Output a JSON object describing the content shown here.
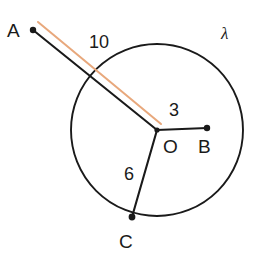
{
  "figure": {
    "kind": "circle-geometry-diagram",
    "width": 274,
    "height": 258,
    "background_color": "#ffffff"
  },
  "colors": {
    "stroke": "#1a1a1a",
    "highlight": "#e8a87c",
    "text": "#1a1a1a"
  },
  "circle": {
    "name": "lambda",
    "label": "λ",
    "center_label": "O",
    "center": {
      "x": 157,
      "y": 130
    },
    "radius": 86
  },
  "points": [
    {
      "id": "A",
      "label": "A",
      "x": 33,
      "y": 30,
      "on_circle": false,
      "dot": true
    },
    {
      "id": "B",
      "label": "B",
      "x": 207,
      "y": 128,
      "on_circle": false,
      "dot": true
    },
    {
      "id": "C",
      "label": "C",
      "x": 132,
      "y": 217,
      "on_circle": true,
      "dot": true
    },
    {
      "id": "O",
      "label": "O",
      "x": 157,
      "y": 130,
      "on_circle": false,
      "dot": true
    }
  ],
  "segments": [
    {
      "id": "AO",
      "from": "A",
      "to": "O",
      "length_label": "10",
      "color": "#1a1a1a",
      "x1": 33,
      "y1": 30,
      "x2": 157,
      "y2": 130
    },
    {
      "id": "OB",
      "from": "O",
      "to": "B",
      "length_label": "3",
      "color": "#1a1a1a",
      "x1": 157,
      "y1": 130,
      "x2": 207,
      "y2": 128
    },
    {
      "id": "OC",
      "from": "O",
      "to": "C",
      "length_label": "6",
      "color": "#1a1a1a",
      "x1": 157,
      "y1": 130,
      "x2": 132,
      "y2": 217
    }
  ],
  "highlight_segment": {
    "id": "tangent-parallel-marker",
    "color": "#e8a87c",
    "x1": 38,
    "y1": 22,
    "x2": 161,
    "y2": 124
  },
  "labels": {
    "point_a": "A",
    "point_b": "B",
    "point_c": "C",
    "point_o": "O",
    "curve_lambda": "λ",
    "length_ao": "10",
    "length_ob": "3",
    "length_oc": "6"
  }
}
